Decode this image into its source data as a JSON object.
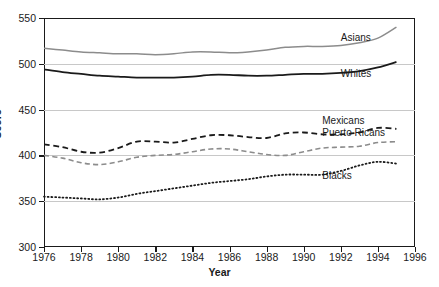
{
  "chart_data": {
    "type": "line",
    "title": "",
    "xlabel": "Year",
    "ylabel": "Score",
    "xlim": [
      1976,
      1996
    ],
    "ylim": [
      300,
      550
    ],
    "yticks": [
      300,
      350,
      400,
      450,
      500,
      550
    ],
    "xticks": [
      1976,
      1978,
      1980,
      1982,
      1984,
      1986,
      1988,
      1990,
      1992,
      1994,
      1996
    ],
    "grid": true,
    "legend_position": "inline-right",
    "x": [
      1976,
      1977,
      1978,
      1979,
      1980,
      1981,
      1982,
      1983,
      1984,
      1985,
      1986,
      1987,
      1988,
      1989,
      1990,
      1991,
      1992,
      1993,
      1994,
      1995
    ],
    "series": [
      {
        "name": "Asians",
        "style": "solid",
        "color": "#8c8c8c",
        "width": 1.5,
        "label_year": 1992,
        "label_value": 528,
        "values": [
          517,
          515,
          513,
          512,
          511,
          511,
          510,
          511,
          513,
          513,
          512,
          513,
          515,
          518,
          519,
          519,
          520,
          523,
          528,
          540
        ]
      },
      {
        "name": "Whites",
        "style": "solid",
        "color": "#1a1a1a",
        "width": 1.8,
        "label_year": 1992,
        "label_value": 489,
        "values": [
          494,
          491,
          489,
          487,
          486,
          485,
          485,
          485,
          486,
          488,
          488,
          487,
          487,
          488,
          489,
          489,
          490,
          492,
          496,
          502
        ]
      },
      {
        "name": "Mexicans",
        "style": "dashed",
        "color": "#1a1a1a",
        "width": 1.8,
        "label_year": 1991,
        "label_value": 438,
        "values": [
          412,
          409,
          404,
          403,
          408,
          415,
          415,
          414,
          418,
          422,
          422,
          420,
          419,
          424,
          425,
          423,
          423,
          425,
          430,
          429
        ]
      },
      {
        "name": "Puerto Ricans",
        "style": "dashed",
        "color": "#8c8c8c",
        "width": 1.6,
        "label_year": 1991,
        "label_value": 425,
        "values": [
          400,
          397,
          392,
          390,
          393,
          398,
          400,
          401,
          404,
          407,
          407,
          404,
          401,
          400,
          404,
          408,
          409,
          410,
          414,
          415
        ]
      },
      {
        "name": "Blacks",
        "style": "dotted",
        "color": "#1a1a1a",
        "width": 1.8,
        "label_year": 1991,
        "label_value": 378,
        "values": [
          355,
          354,
          353,
          352,
          354,
          358,
          361,
          364,
          367,
          370,
          372,
          374,
          377,
          379,
          379,
          379,
          383,
          389,
          393,
          391
        ]
      }
    ]
  }
}
